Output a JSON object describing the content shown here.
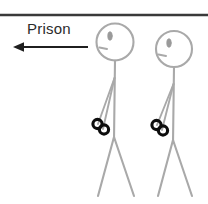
{
  "image": {
    "width": 208,
    "height": 204,
    "background_color": "#ffffff",
    "description": "Line drawing of two handcuffed stick figures with an arrow labeled Prison pointing left"
  },
  "annotation": {
    "label": "Prison",
    "label_color": "#2b2b2b",
    "arrow": {
      "direction": "left",
      "color": "#1f1f1f",
      "start_x": 88,
      "end_x": 14,
      "y": 47
    }
  },
  "divider": {
    "name": "top-horizontal-rule",
    "color": "#3a3a3a",
    "y": 15,
    "x_start": 0,
    "x_end": 208,
    "thickness": 2.6
  },
  "figures": [
    {
      "id": "figure-left",
      "stroke_color": "#a9a9a9",
      "head": {
        "cx": 115,
        "cy": 42,
        "r": 18.5
      },
      "eye": {
        "cx": 110,
        "cy": 36,
        "rx": 2.2,
        "ry": 4.2,
        "color": "#9a9a9a"
      },
      "mouth": {
        "x1": 99.5,
        "y1": 47.5,
        "x2": 107,
        "y2": 49
      },
      "spine": {
        "x1": 115,
        "y1": 60.5,
        "x2": 114,
        "y2": 140
      },
      "arms": [
        {
          "x1": 114.5,
          "y1": 78,
          "x2": 98,
          "y2": 124
        },
        {
          "x1": 114.5,
          "y1": 78,
          "x2": 103,
          "y2": 129
        }
      ],
      "legs": [
        {
          "x1": 114,
          "y1": 137,
          "x2": 98,
          "y2": 196
        },
        {
          "x1": 114,
          "y1": 137,
          "x2": 134,
          "y2": 196
        }
      ],
      "handcuffs": {
        "color": "#0d0d0d",
        "rings": [
          {
            "cx": 97.5,
            "cy": 124,
            "r": 4.6
          },
          {
            "cx": 104,
            "cy": 129.5,
            "r": 4.6
          }
        ]
      }
    },
    {
      "id": "figure-right",
      "stroke_color": "#a9a9a9",
      "head": {
        "cx": 174,
        "cy": 49,
        "r": 18.0
      },
      "eye": {
        "cx": 169,
        "cy": 43,
        "rx": 2.2,
        "ry": 4.2,
        "color": "#9a9a9a"
      },
      "mouth": {
        "x1": 158.5,
        "y1": 54.5,
        "x2": 166,
        "y2": 56
      },
      "spine": {
        "x1": 174,
        "y1": 67,
        "x2": 173,
        "y2": 143
      },
      "arms": [
        {
          "x1": 173.5,
          "y1": 84,
          "x2": 157,
          "y2": 125
        },
        {
          "x1": 173.5,
          "y1": 84,
          "x2": 162,
          "y2": 130
        }
      ],
      "legs": [
        {
          "x1": 173,
          "y1": 140,
          "x2": 158,
          "y2": 196
        },
        {
          "x1": 173,
          "y1": 140,
          "x2": 192,
          "y2": 196
        }
      ],
      "handcuffs": {
        "color": "#0d0d0d",
        "rings": [
          {
            "cx": 156.5,
            "cy": 125,
            "r": 4.6
          },
          {
            "cx": 163,
            "cy": 130.5,
            "r": 4.6
          }
        ]
      }
    }
  ]
}
